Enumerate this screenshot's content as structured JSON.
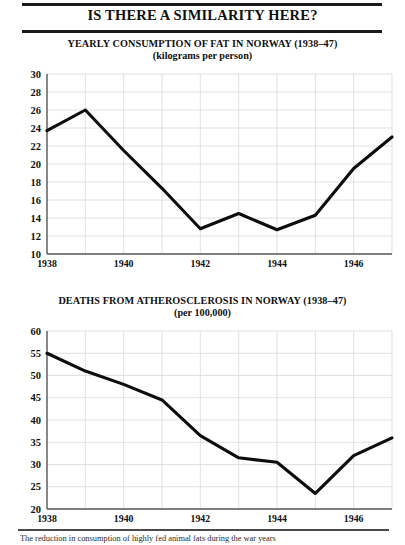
{
  "header": {
    "title": "IS THERE A SIMILARITY HERE?"
  },
  "footer": {
    "caption": "The reduction in consumption of highly fed animal fats during the war years"
  },
  "chart_data": [
    {
      "id": "fat-consumption",
      "type": "line",
      "title": "YEARLY CONSUMPTION OF FAT IN NORWAY (1938–47)",
      "subtitle": "(kilograms per person)",
      "xlabel": "",
      "ylabel": "",
      "x": [
        1938,
        1939,
        1940,
        1941,
        1942,
        1943,
        1944,
        1945,
        1946,
        1947
      ],
      "values": [
        23.7,
        26.0,
        21.5,
        17.3,
        12.8,
        14.5,
        12.7,
        14.3,
        19.5,
        23.0
      ],
      "xlim": [
        1938,
        1947
      ],
      "ylim": [
        10,
        30
      ],
      "yticks": [
        10,
        12,
        14,
        16,
        18,
        20,
        22,
        24,
        26,
        28,
        30
      ],
      "ytick_labels": [
        "10",
        "12",
        "14",
        "16",
        "18",
        "20",
        "22",
        "24",
        "26",
        "28",
        "30"
      ],
      "xticks": [
        1938,
        1940,
        1942,
        1944,
        1946
      ],
      "xtick_labels": [
        "1938",
        "1940",
        "1942",
        "1944",
        "1946"
      ],
      "grid": true,
      "line_color": "#0d0d0d",
      "grid_color": "#d8d8d8",
      "axis_color": "#555555",
      "legend": "none"
    },
    {
      "id": "atherosclerosis-deaths",
      "type": "line",
      "title": "DEATHS FROM ATHEROSCLEROSIS IN NORWAY (1938–47)",
      "subtitle": "(per 100,000)",
      "xlabel": "",
      "ylabel": "",
      "x": [
        1938,
        1939,
        1940,
        1941,
        1942,
        1943,
        1944,
        1945,
        1946,
        1947
      ],
      "values": [
        55.0,
        51.0,
        48.0,
        44.5,
        36.5,
        31.5,
        30.5,
        23.5,
        32.0,
        36.0
      ],
      "xlim": [
        1938,
        1947
      ],
      "ylim": [
        20,
        60
      ],
      "yticks": [
        20,
        25,
        30,
        35,
        40,
        45,
        50,
        55,
        60
      ],
      "ytick_labels": [
        "20",
        "25",
        "30",
        "35",
        "40",
        "45",
        "50",
        "55",
        "60"
      ],
      "xticks": [
        1938,
        1940,
        1942,
        1944,
        1946
      ],
      "xtick_labels": [
        "1938",
        "1940",
        "1942",
        "1944",
        "1946"
      ],
      "grid": true,
      "line_color": "#0d0d0d",
      "grid_color": "#d8d8d8",
      "axis_color": "#555555",
      "legend": "none"
    }
  ]
}
